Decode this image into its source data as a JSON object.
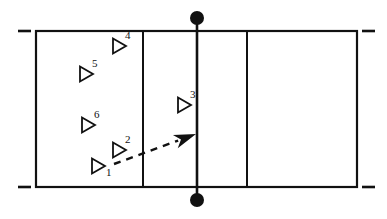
{
  "diagram": {
    "court": {
      "boundary_name": "court-boundary",
      "left": 36,
      "top": 31,
      "right": 357,
      "bottom": 187,
      "stroke_color": "#111111",
      "attack_line_left_x": 143,
      "attack_line_right_x": 247,
      "center_net_line_x": 197
    },
    "net": {
      "label": "net",
      "post_top": {
        "cx": 197,
        "cy": 18,
        "r": 7
      },
      "post_bottom": {
        "cx": 197,
        "cy": 200,
        "r": 7
      },
      "line_color": "#111111"
    },
    "sideline_ticks": [
      {
        "name": "tick-top-left",
        "x1": 18,
        "x2": 31,
        "y": 31
      },
      {
        "name": "tick-top-right",
        "x1": 362,
        "x2": 375,
        "y": 31
      },
      {
        "name": "tick-bottom-left",
        "x1": 18,
        "x2": 31,
        "y": 187
      },
      {
        "name": "tick-bottom-right",
        "x1": 362,
        "x2": 375,
        "y": 187
      }
    ],
    "players": [
      {
        "id": "player-1",
        "number": "1",
        "x": 92,
        "y": 166,
        "label_pos": "subscript"
      },
      {
        "id": "player-2",
        "number": "2",
        "x": 113,
        "y": 150,
        "label_pos": "superscript"
      },
      {
        "id": "player-3",
        "number": "3",
        "x": 178,
        "y": 105,
        "label_pos": "superscript"
      },
      {
        "id": "player-4",
        "number": "4",
        "x": 113,
        "y": 46,
        "label_pos": "superscript"
      },
      {
        "id": "player-5",
        "number": "5",
        "x": 80,
        "y": 74,
        "label_pos": "superscript"
      },
      {
        "id": "player-6",
        "number": "6",
        "x": 82,
        "y": 125,
        "label_pos": "superscript"
      }
    ],
    "movement_arrow": {
      "name": "movement-arrow",
      "style": "dashed-with-solid-head",
      "start_x": 114,
      "start_y": 164,
      "end_x": 196,
      "end_y": 134,
      "dash_pattern": "7,6",
      "color": "#111111"
    },
    "colors": {
      "ink": "#111111",
      "paper": "#ffffff"
    }
  }
}
